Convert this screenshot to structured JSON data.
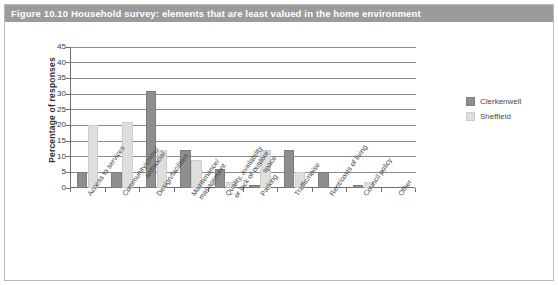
{
  "figure": {
    "caption": "Figure 10.10  Household survey: elements that are least valued in the home environment",
    "caption_bar_color": "#9b9b9b",
    "border_color": "#b9b9b9"
  },
  "legend": {
    "position": "right",
    "entries": [
      {
        "label": "Clerkenwell",
        "color": "#8e8e8e",
        "swatch_name": "legend-swatch-clerkenwell"
      },
      {
        "label": "Sheffield",
        "color": "#dedede",
        "swatch_name": "legend-swatch-sheffield"
      }
    ]
  },
  "chart_data": {
    "type": "bar",
    "title": "Figure 10.10  Household survey: elements that are least valued in the home environment",
    "xlabel": "",
    "ylabel": "Percentage of responses",
    "ylim": [
      0,
      45
    ],
    "yticks": [
      0,
      5,
      10,
      15,
      20,
      25,
      30,
      35,
      40,
      45
    ],
    "ytick_labels": [
      "0",
      "5",
      "10",
      "15",
      "20",
      "25",
      "30",
      "35",
      "40",
      "45"
    ],
    "grid": true,
    "grid_axis": "y",
    "legend_position": "right",
    "categories": [
      "Access to services",
      "Community/crime/antisocial",
      "Design/facilities",
      "Maintenance/management",
      "Quality, availability or lack of outdoor space",
      "Parking",
      "Traffic/noise",
      "Rent/costs of living",
      "Council policy",
      "Other"
    ],
    "category_lines": [
      [
        "Access to services"
      ],
      [
        "Community/crime/",
        "antisocial"
      ],
      [
        "Design/facilities"
      ],
      [
        "Maintenance/",
        "management"
      ],
      [
        "Quality, availability",
        "or lack of outdoor",
        "space"
      ],
      [
        "Parking"
      ],
      [
        "Traffic/noise"
      ],
      [
        "Rent/costs of living"
      ],
      [
        "Council policy"
      ],
      [
        "Other"
      ]
    ],
    "series": [
      {
        "name": "Clerkenwell",
        "color": "#8e8e8e",
        "values": [
          5,
          5,
          31,
          12,
          6,
          1,
          12,
          5,
          1,
          0
        ]
      },
      {
        "name": "Sheffield",
        "color": "#dedede",
        "values": [
          20,
          21,
          12,
          9,
          2,
          12,
          5,
          0,
          2,
          0
        ]
      }
    ]
  }
}
